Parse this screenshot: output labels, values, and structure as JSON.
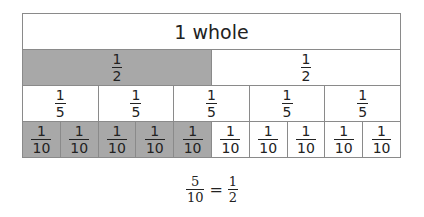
{
  "diagram": {
    "colors": {
      "shaded": "#a8a8a8",
      "unshaded": "#ffffff",
      "border": "#8a8a8a"
    },
    "rows": [
      {
        "id": "whole",
        "cells": [
          {
            "label": "1 whole",
            "shaded": false
          }
        ]
      },
      {
        "id": "halves",
        "cells": [
          {
            "num": "1",
            "den": "2",
            "shaded": true
          },
          {
            "num": "1",
            "den": "2",
            "shaded": false
          }
        ]
      },
      {
        "id": "fifths",
        "cells": [
          {
            "num": "1",
            "den": "5",
            "shaded": false
          },
          {
            "num": "1",
            "den": "5",
            "shaded": false
          },
          {
            "num": "1",
            "den": "5",
            "shaded": false
          },
          {
            "num": "1",
            "den": "5",
            "shaded": false
          },
          {
            "num": "1",
            "den": "5",
            "shaded": false
          }
        ]
      },
      {
        "id": "tenths",
        "cells": [
          {
            "num": "1",
            "den": "10",
            "shaded": true
          },
          {
            "num": "1",
            "den": "10",
            "shaded": true
          },
          {
            "num": "1",
            "den": "10",
            "shaded": true
          },
          {
            "num": "1",
            "den": "10",
            "shaded": true
          },
          {
            "num": "1",
            "den": "10",
            "shaded": true
          },
          {
            "num": "1",
            "den": "10",
            "shaded": false
          },
          {
            "num": "1",
            "den": "10",
            "shaded": false
          },
          {
            "num": "1",
            "den": "10",
            "shaded": false
          },
          {
            "num": "1",
            "den": "10",
            "shaded": false
          },
          {
            "num": "1",
            "den": "10",
            "shaded": false
          }
        ]
      }
    ],
    "equation": {
      "left_num": "5",
      "left_den": "10",
      "operator": "=",
      "right_num": "1",
      "right_den": "2"
    }
  }
}
